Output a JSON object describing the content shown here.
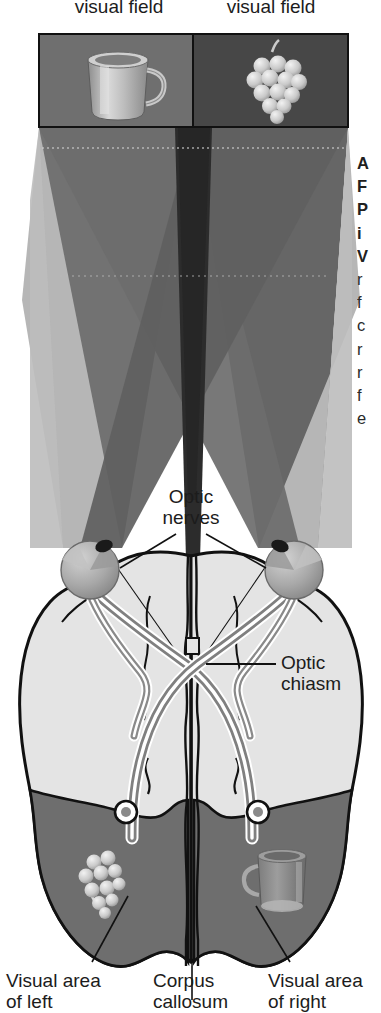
{
  "figure": {
    "type": "anatomical-diagram"
  },
  "top_labels": {
    "left": "visual field",
    "left_full": "Left\nvisual field",
    "right": "visual field",
    "right_full": "Right\nvisual field"
  },
  "scene_panels": {
    "left": {
      "object": "mug-illustration",
      "background": "#6f6f6f"
    },
    "right": {
      "object": "grapes-illustration",
      "background": "#4a4a4a"
    }
  },
  "callouts": {
    "optic_nerves": "Optic\nnerves",
    "optic_nerves_line1": "Optic",
    "optic_nerves_line2": "nerves",
    "optic_chiasm_line1": "Optic",
    "optic_chiasm_line2": "chiasm"
  },
  "bottom_labels": {
    "left_line1": "Visual area",
    "left_line2": "of left",
    "center_line1": "Corpus",
    "center_line2": "callosum",
    "right_line1": "Visual area",
    "right_line2": "of right"
  },
  "caption": {
    "heading_lines": [
      "A",
      "F",
      "P",
      "i",
      "V"
    ],
    "body_lines": [
      "r",
      "f",
      "c",
      "r",
      "r",
      "f",
      "e",
      "l",
      "f",
      "c",
      "h",
      "i",
      "r",
      "l",
      "t"
    ]
  },
  "brain": {
    "left_hemisphere_object": "grapes-illustration",
    "right_hemisphere_object": "mug-illustration",
    "visual_area_fill": "#6e6e6e",
    "cortex_fill": "#e2e2e2"
  },
  "colors": {
    "cone_outer": "#b8b8b8",
    "cone_mid": "#636363",
    "cone_center": "#2b2b2b",
    "panel_left": "#6f6f6f",
    "panel_right": "#474747",
    "outline": "#111111",
    "nerve": "#7d7d7d",
    "eye": "#a9a9a9"
  }
}
